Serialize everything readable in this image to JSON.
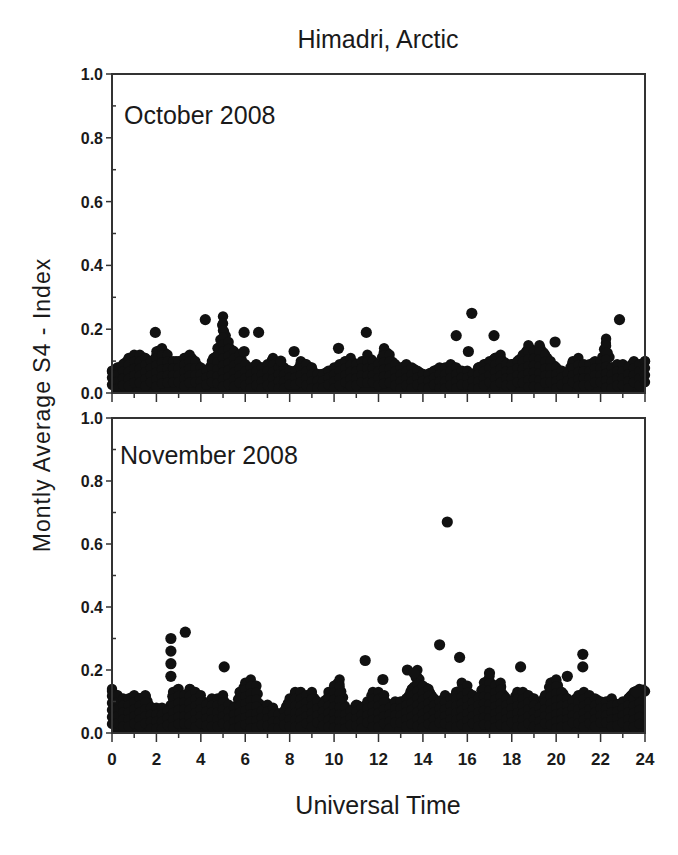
{
  "figure": {
    "title": "Himadri, Arctic",
    "ylabel": "Montly Average S4 - Index",
    "xlabel": "Universal Time",
    "x_ticks": [
      "0",
      "2",
      "4",
      "6",
      "8",
      "10",
      "12",
      "14",
      "16",
      "18",
      "20",
      "22",
      "24"
    ],
    "y_ticks": [
      "0.0",
      "0.2",
      "0.4",
      "0.6",
      "0.8",
      "1.0"
    ],
    "marker_color": "#111111",
    "frame_color": "#333333"
  },
  "chart_data": [
    {
      "type": "scatter",
      "title": "October 2008",
      "panel": "top",
      "xlabel": "Universal Time",
      "ylabel": "Montly Average S4 - Index",
      "xlim": [
        0,
        24
      ],
      "ylim": [
        0.0,
        1.0
      ],
      "x_ticks": [
        0,
        2,
        4,
        6,
        8,
        10,
        12,
        14,
        16,
        18,
        20,
        22,
        24
      ],
      "y_ticks": [
        0.0,
        0.2,
        0.4,
        0.6,
        0.8,
        1.0
      ],
      "grid": false,
      "legend": null,
      "envelope_step_hours": 0.25,
      "envelope_max": [
        0.07,
        0.08,
        0.09,
        0.11,
        0.12,
        0.12,
        0.11,
        0.1,
        0.13,
        0.14,
        0.12,
        0.1,
        0.1,
        0.11,
        0.12,
        0.1,
        0.08,
        0.07,
        0.1,
        0.14,
        0.24,
        0.16,
        0.13,
        0.12,
        0.09,
        0.08,
        0.09,
        0.08,
        0.09,
        0.11,
        0.08,
        0.08,
        0.07,
        0.07,
        0.1,
        0.09,
        0.08,
        0.06,
        0.06,
        0.07,
        0.08,
        0.09,
        0.1,
        0.11,
        0.09,
        0.1,
        0.12,
        0.1,
        0.09,
        0.14,
        0.12,
        0.09,
        0.08,
        0.09,
        0.08,
        0.07,
        0.06,
        0.06,
        0.07,
        0.08,
        0.08,
        0.09,
        0.08,
        0.07,
        0.07,
        0.06,
        0.08,
        0.09,
        0.1,
        0.11,
        0.12,
        0.09,
        0.09,
        0.1,
        0.12,
        0.15,
        0.13,
        0.15,
        0.12,
        0.1,
        0.08,
        0.07,
        0.06,
        0.1,
        0.11,
        0.09,
        0.09,
        0.1,
        0.1,
        0.17,
        0.08,
        0.09,
        0.09,
        0.08,
        0.1,
        0.09,
        0.1
      ],
      "outliers": [
        {
          "x": 1.95,
          "y": 0.19
        },
        {
          "x": 4.2,
          "y": 0.23
        },
        {
          "x": 5.95,
          "y": 0.19
        },
        {
          "x": 5.95,
          "y": 0.13
        },
        {
          "x": 6.6,
          "y": 0.19
        },
        {
          "x": 7.6,
          "y": 0.1
        },
        {
          "x": 8.2,
          "y": 0.13
        },
        {
          "x": 10.2,
          "y": 0.14
        },
        {
          "x": 11.45,
          "y": 0.19
        },
        {
          "x": 15.5,
          "y": 0.18
        },
        {
          "x": 16.2,
          "y": 0.25
        },
        {
          "x": 16.05,
          "y": 0.13
        },
        {
          "x": 17.2,
          "y": 0.18
        },
        {
          "x": 19.95,
          "y": 0.16
        },
        {
          "x": 22.85,
          "y": 0.23
        }
      ]
    },
    {
      "type": "scatter",
      "title": "November 2008",
      "panel": "bottom",
      "xlabel": "Universal Time",
      "ylabel": "Montly Average S4 - Index",
      "xlim": [
        0,
        24
      ],
      "ylim": [
        0.0,
        1.0
      ],
      "x_ticks": [
        0,
        2,
        4,
        6,
        8,
        10,
        12,
        14,
        16,
        18,
        20,
        22,
        24
      ],
      "y_ticks": [
        0.0,
        0.2,
        0.4,
        0.6,
        0.8,
        1.0
      ],
      "grid": false,
      "legend": null,
      "envelope_step_hours": 0.25,
      "envelope_max": [
        0.14,
        0.12,
        0.11,
        0.11,
        0.12,
        0.11,
        0.12,
        0.08,
        0.08,
        0.08,
        0.07,
        0.13,
        0.14,
        0.12,
        0.14,
        0.13,
        0.12,
        0.09,
        0.11,
        0.11,
        0.12,
        0.09,
        0.08,
        0.13,
        0.16,
        0.17,
        0.15,
        0.07,
        0.09,
        0.08,
        0.06,
        0.07,
        0.11,
        0.13,
        0.13,
        0.12,
        0.13,
        0.1,
        0.09,
        0.13,
        0.15,
        0.17,
        0.08,
        0.07,
        0.09,
        0.08,
        0.1,
        0.13,
        0.13,
        0.12,
        0.08,
        0.1,
        0.1,
        0.11,
        0.14,
        0.2,
        0.15,
        0.14,
        0.11,
        0.1,
        0.12,
        0.11,
        0.13,
        0.16,
        0.15,
        0.12,
        0.11,
        0.16,
        0.18,
        0.15,
        0.16,
        0.11,
        0.1,
        0.13,
        0.13,
        0.12,
        0.11,
        0.08,
        0.12,
        0.16,
        0.17,
        0.13,
        0.11,
        0.1,
        0.12,
        0.13,
        0.12,
        0.11,
        0.1,
        0.1,
        0.11,
        0.09,
        0.1,
        0.11,
        0.13,
        0.14
      ],
      "outliers": [
        {
          "x": 2.65,
          "y": 0.3
        },
        {
          "x": 2.65,
          "y": 0.26
        },
        {
          "x": 2.65,
          "y": 0.22
        },
        {
          "x": 2.65,
          "y": 0.18
        },
        {
          "x": 3.3,
          "y": 0.32
        },
        {
          "x": 5.05,
          "y": 0.21
        },
        {
          "x": 11.4,
          "y": 0.23
        },
        {
          "x": 12.2,
          "y": 0.17
        },
        {
          "x": 13.3,
          "y": 0.2
        },
        {
          "x": 13.6,
          "y": 0.19
        },
        {
          "x": 14.75,
          "y": 0.28
        },
        {
          "x": 15.1,
          "y": 0.67
        },
        {
          "x": 15.65,
          "y": 0.24
        },
        {
          "x": 17.0,
          "y": 0.19
        },
        {
          "x": 18.4,
          "y": 0.21
        },
        {
          "x": 20.5,
          "y": 0.18
        },
        {
          "x": 21.2,
          "y": 0.25
        },
        {
          "x": 21.2,
          "y": 0.21
        },
        {
          "x": 23.6,
          "y": 0.13
        }
      ]
    }
  ]
}
